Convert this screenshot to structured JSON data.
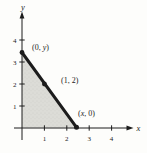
{
  "figure": {
    "axis": {
      "x_label": "x",
      "y_label": "y",
      "x_ticks": [
        "1",
        "2",
        "3",
        "4"
      ],
      "y_ticks": [
        "1",
        "2",
        "3",
        "4"
      ]
    },
    "point_labels": {
      "y_intercept": {
        "pre": "(0, ",
        "var": "y",
        "post": ")"
      },
      "known_point": {
        "text": "(1, 2)"
      },
      "x_intercept": {
        "pre": "(",
        "var": "x",
        "post": ", 0)"
      }
    },
    "colors": {
      "ink": "#1c1c1c",
      "shade_fill": "#dcdcd7",
      "shade_speckle": "#c4c4bd",
      "background": "#fdfdfb"
    }
  }
}
